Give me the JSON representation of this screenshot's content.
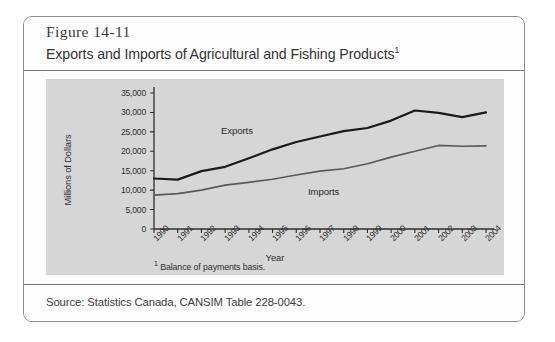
{
  "figure": {
    "number": "Figure 14-11",
    "title": "Exports and Imports of Agricultural and Fishing Products",
    "title_superscript": "1",
    "footnote_marker": "1",
    "footnote": " Balance of payments basis.",
    "source": "Source: Statistics Canada, CANSIM Table 228-0043."
  },
  "chart_data": {
    "type": "line",
    "title": "Exports and Imports of Agricultural and Fishing Products",
    "xlabel": "Year",
    "ylabel": "Millions of Dollars",
    "categories": [
      "1990",
      "1991",
      "1992",
      "1993",
      "1994",
      "1995",
      "1996",
      "1997",
      "1998",
      "1999",
      "2000",
      "2001",
      "2002",
      "2003",
      "2004"
    ],
    "ylim": [
      0,
      35000
    ],
    "yticks": [
      0,
      5000,
      10000,
      15000,
      20000,
      25000,
      30000,
      35000
    ],
    "ytick_labels": [
      "0",
      "5,000",
      "10,000",
      "15,000",
      "20,000",
      "25,000",
      "30,000",
      "35,000"
    ],
    "grid": false,
    "legend": "inline-labels",
    "series": [
      {
        "name": "Exports",
        "color": "#1a1a1a",
        "values": [
          13000,
          12700,
          14900,
          16000,
          18200,
          20500,
          22400,
          23800,
          25200,
          26000,
          27900,
          30500,
          29900,
          28800,
          30000
        ]
      },
      {
        "name": "Imports",
        "color": "#5a5a5a",
        "values": [
          8700,
          9100,
          10000,
          11300,
          12000,
          12800,
          13900,
          14900,
          15500,
          16800,
          18500,
          20000,
          21500,
          21300,
          21400
        ]
      }
    ]
  },
  "colors": {
    "panel": "#d6d6d6",
    "exports_line": "#1a1a1a",
    "imports_line": "#5a5a5a",
    "axis": "#2e2e2e"
  }
}
